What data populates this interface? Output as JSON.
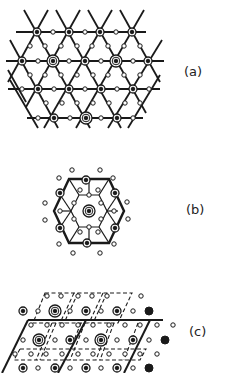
{
  "figure": {
    "panels": [
      {
        "id": "a",
        "label": "(a)",
        "description": "Kagome-like triangular lattice of bonded atoms with mid-bond small circles; some sites marked with concentric rings"
      },
      {
        "id": "b",
        "label": "(b)",
        "description": "Hexagonal cluster with central concentric-ring atom, spokes and surrounding small circles"
      },
      {
        "id": "c",
        "label": "(c)",
        "description": "Superposed rhombic unit cells (solid and dashed) over an array of atoms of varying markers"
      }
    ],
    "legend": {
      "large_ring": "concentric ring atom",
      "ring_dot": "ring with dark center",
      "small_open": "small open circle",
      "filled": "filled black circle"
    },
    "colors": {
      "ink": "#1a1a1a",
      "paper": "#ffffff"
    }
  }
}
